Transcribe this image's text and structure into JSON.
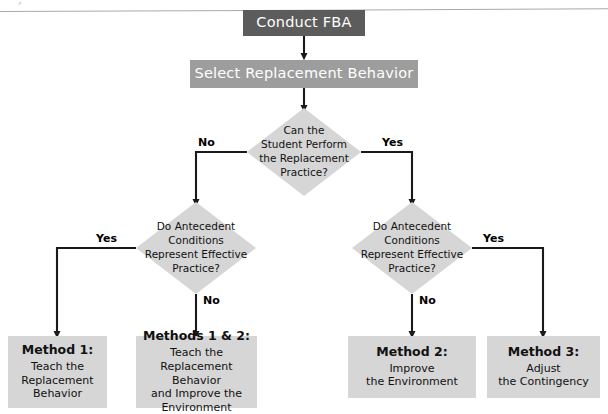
{
  "diagram": {
    "colors": {
      "dark_box": "#5c5c5c",
      "mid_box": "#9d9d9d",
      "light_shape": "#d6d6d6",
      "text_on_dark": "#ffffff",
      "text_dark": "#111111",
      "connector": "#1a1a1a"
    },
    "start": {
      "label": "Conduct FBA"
    },
    "step2": {
      "label": "Select Replacement Behavior"
    },
    "decision1": {
      "lines": [
        "Can the",
        "Student Perform",
        "the Replacement",
        "Practice?"
      ],
      "branch_left": "No",
      "branch_right": "Yes"
    },
    "decision2_left": {
      "lines": [
        "Do Antecedent",
        "Conditions",
        "Represent Effective",
        "Practice?"
      ],
      "branch_left": "Yes",
      "branch_down": "No"
    },
    "decision2_right": {
      "lines": [
        "Do Antecedent",
        "Conditions",
        "Represent Effective",
        "Practice?"
      ],
      "branch_right": "Yes",
      "branch_down": "No"
    },
    "outcomes": [
      {
        "heading": "Method 1:",
        "lines": [
          "Teach the",
          "Replacement",
          "Behavior"
        ]
      },
      {
        "heading": "Methods 1 & 2:",
        "lines": [
          "Teach the",
          "Replacement Behavior",
          "and Improve the",
          "Environment"
        ]
      },
      {
        "heading": "Method 2:",
        "lines": [
          "Improve",
          "the Environment"
        ]
      },
      {
        "heading": "Method 3:",
        "lines": [
          "Adjust",
          "the Contingency"
        ]
      }
    ]
  }
}
